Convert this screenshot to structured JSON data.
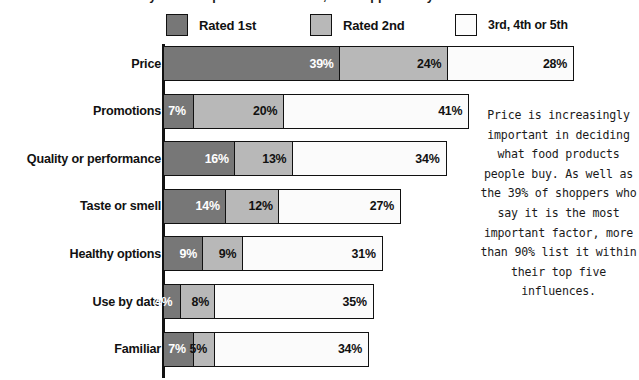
{
  "top_cropped_line": "may not be a permanent feature, as shoppers may",
  "legend": {
    "items": [
      {
        "label": "Rated 1st",
        "color": "#777777",
        "swatch": "dark-gray-swatch"
      },
      {
        "label": "Rated 2nd",
        "color": "#b8b8b8",
        "swatch": "light-gray-swatch"
      },
      {
        "label": "3rd, 4th or 5th",
        "color": "#fcfcfc",
        "swatch": "white-swatch"
      }
    ]
  },
  "caption": "Price is increasingly important in deciding what food products people buy. As well as the 39% of shoppers who say it is the most important factor, more than 90% list it within their top five influences.",
  "chart_data": {
    "type": "bar",
    "orientation": "horizontal",
    "stacked": true,
    "title": "",
    "xlabel": "",
    "ylabel": "",
    "grid": false,
    "legend_position": "top",
    "axis_visible": "y-axis-only",
    "xlim": [
      0,
      95
    ],
    "categories": [
      "Price",
      "Promotions",
      "Quality or performance",
      "Taste or smell",
      "Healthy options",
      "Use by date",
      "Familiar"
    ],
    "series": [
      {
        "name": "Rated 1st",
        "color": "#777777",
        "values": [
          39,
          7,
          16,
          14,
          9,
          4,
          7
        ]
      },
      {
        "name": "Rated 2nd",
        "color": "#b8b8b8",
        "values": [
          24,
          20,
          13,
          12,
          9,
          8,
          5
        ]
      },
      {
        "name": "3rd, 4th or 5th",
        "color": "#fcfcfc",
        "values": [
          28,
          41,
          34,
          27,
          31,
          35,
          34
        ]
      }
    ],
    "labels": [
      [
        "39%",
        "24%",
        "28%"
      ],
      [
        "7%",
        "20%",
        "41%"
      ],
      [
        "16%",
        "13%",
        "34%"
      ],
      [
        "14%",
        "12%",
        "27%"
      ],
      [
        "9%",
        "9%",
        "31%"
      ],
      [
        "4%",
        "8%",
        "35%"
      ],
      [
        "7%",
        "5%",
        "34%"
      ]
    ],
    "totals": [
      91,
      68,
      63,
      53,
      49,
      47,
      46
    ]
  }
}
